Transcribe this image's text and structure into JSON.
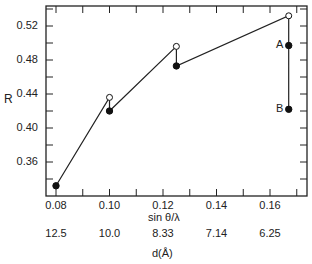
{
  "chart_data": {
    "type": "line",
    "title": "",
    "xlabel": "sin θ/λ",
    "xlabel_secondary": "d(Å)",
    "ylabel": "R",
    "xlim": [
      0.0775,
      0.1725
    ],
    "ylim": [
      0.32,
      0.54
    ],
    "grid": false,
    "x_ticks": [
      "0.08",
      "0.10",
      "0.12",
      "0.14",
      "0.16"
    ],
    "x_ticks_secondary": [
      "12.5",
      "10.0",
      "8.33",
      "7.14",
      "6.25"
    ],
    "y_ticks": [
      "0.36",
      "0.40",
      "0.44",
      "0.48",
      "0.52"
    ],
    "series": [
      {
        "name": "R vs sin θ/λ",
        "points": [
          {
            "x": 0.08,
            "y": 0.332,
            "marker": "filled"
          },
          {
            "x": 0.1,
            "y": 0.436,
            "marker": "open"
          },
          {
            "x": 0.1,
            "y": 0.42,
            "marker": "filled"
          },
          {
            "x": 0.125,
            "y": 0.496,
            "marker": "open"
          },
          {
            "x": 0.125,
            "y": 0.473,
            "marker": "filled"
          },
          {
            "x": 0.167,
            "y": 0.532,
            "marker": "open"
          },
          {
            "x": 0.167,
            "y": 0.497,
            "marker": "filled",
            "label": "A"
          },
          {
            "x": 0.167,
            "y": 0.422,
            "marker": "filled",
            "label": "B"
          }
        ]
      }
    ],
    "annotations": [
      "A",
      "B"
    ]
  },
  "labels": {
    "ylabel": "R",
    "xlabel": "sin θ/λ",
    "xlabel2": "d(Å)",
    "A": "A",
    "B": "B"
  }
}
